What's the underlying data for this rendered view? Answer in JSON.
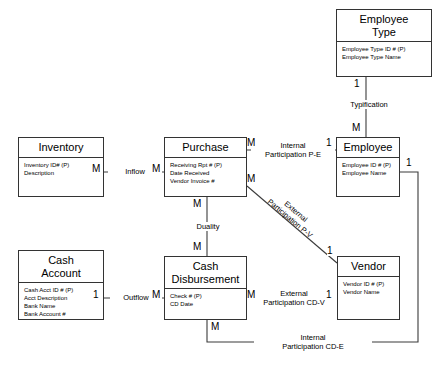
{
  "diagram": {
    "type": "entity-relationship-diagram"
  },
  "entities": [
    {
      "id": "employee-type",
      "name": "Employee\nType",
      "name_line1": "Employee",
      "name_line2": "Type",
      "attributes": [
        "Employee Type ID # (P)",
        "Employee Type Name"
      ]
    },
    {
      "id": "inventory",
      "name": "Inventory",
      "name_line1": "Inventory",
      "name_line2": "",
      "attributes": [
        "Inventory ID# (P)",
        "Description"
      ]
    },
    {
      "id": "purchase",
      "name": "Purchase",
      "name_line1": "Purchase",
      "name_line2": "",
      "attributes": [
        "Receiving Rpt # (P)",
        "Date Received",
        "Vendor Invoice #"
      ]
    },
    {
      "id": "employee",
      "name": "Employee",
      "name_line1": "Employee",
      "name_line2": "",
      "attributes": [
        "Employee ID # (P)",
        "Employee Name"
      ]
    },
    {
      "id": "cash-account",
      "name": "Cash Account",
      "name_line1": "Cash",
      "name_line2": "Account",
      "attributes": [
        "Cash Acct ID # (P)",
        "Acct Description",
        "Bank Name",
        "Bank Account #"
      ]
    },
    {
      "id": "cash-disbursement",
      "name": "Cash Disbursement",
      "name_line1": "Cash",
      "name_line2": "Disbursement",
      "attributes": [
        "Check # (P)",
        "CD Date"
      ]
    },
    {
      "id": "vendor",
      "name": "Vendor",
      "name_line1": "Vendor",
      "name_line2": "",
      "attributes": [
        "Vendor ID # (P)",
        "Vendor Name"
      ]
    }
  ],
  "relationships": [
    {
      "id": "typification",
      "label_line1": "Typification",
      "label_line2": "",
      "from": "employee-type",
      "to": "employee",
      "from_card": "1",
      "to_card": "M"
    },
    {
      "id": "inflow",
      "label_line1": "Inflow",
      "label_line2": "",
      "from": "inventory",
      "to": "purchase",
      "from_card": "M",
      "to_card": "M"
    },
    {
      "id": "internal-participation-pe",
      "label_line1": "Internal",
      "label_line2": "Participation P-E",
      "from": "purchase",
      "to": "employee",
      "from_card": "M",
      "to_card": "1"
    },
    {
      "id": "external-participation-pv",
      "label_line1": "External",
      "label_line2": "Participation P-V",
      "from": "purchase",
      "to": "vendor",
      "from_card": "M",
      "to_card": "1"
    },
    {
      "id": "duality",
      "label_line1": "Duality",
      "label_line2": "",
      "from": "purchase",
      "to": "cash-disbursement",
      "from_card": "M",
      "to_card": "M"
    },
    {
      "id": "outflow",
      "label_line1": "Outflow",
      "label_line2": "",
      "from": "cash-account",
      "to": "cash-disbursement",
      "from_card": "1",
      "to_card": "M"
    },
    {
      "id": "external-participation-cdv",
      "label_line1": "External",
      "label_line2": "Participation CD-V",
      "from": "cash-disbursement",
      "to": "vendor",
      "from_card": "M",
      "to_card": "1"
    },
    {
      "id": "internal-participation-cde",
      "label_line1": "Internal",
      "label_line2": "Participation CD-E",
      "from": "cash-disbursement",
      "to": "employee",
      "from_card": "M",
      "to_card": "1"
    }
  ],
  "cardinality_markers": {
    "typification_from": "1",
    "typification_to": "M",
    "inflow_from": "M",
    "inflow_to": "M",
    "pe_from": "M",
    "pe_to": "1",
    "pv_from": "M",
    "pv_to": "1",
    "duality_top": "M",
    "duality_bottom": "M",
    "outflow_from": "1",
    "outflow_to": "M",
    "cdv_from": "M",
    "cdv_to": "1",
    "cde_from": "M",
    "cde_to": "1"
  },
  "colors": {
    "stroke": "#333333",
    "background": "#ffffff",
    "text": "#000000"
  }
}
